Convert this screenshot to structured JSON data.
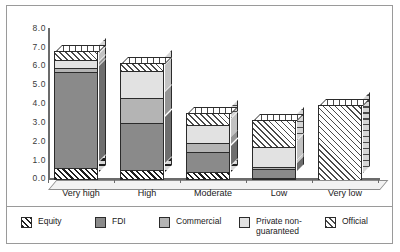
{
  "chart_data": {
    "type": "bar",
    "subtype": "stacked-3d-column",
    "title": "",
    "xlabel": "",
    "ylabel": "",
    "ylim": [
      0.0,
      8.0
    ],
    "ytick_step": 1.0,
    "ytick_labels": [
      "8.0",
      "7.0",
      "6.0",
      "5.0",
      "4.0",
      "3.0",
      "2.0",
      "1.0",
      "0.0"
    ],
    "grid": false,
    "legend_position": "bottom",
    "categories": [
      "Very high",
      "High",
      "Moderate",
      "Low",
      "Very low"
    ],
    "series": [
      {
        "name": "Equity",
        "color": "#1f1f1f",
        "pattern": "diagonal-dark-hatch",
        "values": [
          0.65,
          0.55,
          0.45,
          0.1,
          0.0
        ]
      },
      {
        "name": "FDI",
        "color": "#8a8a8a",
        "pattern": "solid-dark-gray",
        "values": [
          5.1,
          2.5,
          1.05,
          0.5,
          0.0
        ]
      },
      {
        "name": "Commercial",
        "color": "#b4b4b4",
        "pattern": "solid-mid-gray",
        "values": [
          0.2,
          1.3,
          0.45,
          0.1,
          0.0
        ]
      },
      {
        "name": "Private non-guaranteed",
        "color": "#e2e2e2",
        "pattern": "solid-light-gray",
        "values": [
          0.45,
          1.45,
          1.0,
          1.05,
          0.0
        ]
      },
      {
        "name": "Official",
        "color": "#4a4a4a",
        "pattern": "diagonal-light-hatch",
        "values": [
          0.5,
          0.45,
          0.65,
          1.45,
          4.0
        ]
      }
    ],
    "totals": [
      6.9,
      6.25,
      3.6,
      3.2,
      4.0
    ]
  },
  "legend": {
    "items": [
      {
        "label": "Equity",
        "swatch": "equity-swatch"
      },
      {
        "label": "FDI",
        "swatch": "fdi-swatch"
      },
      {
        "label": "Commercial",
        "swatch": "commercial-swatch"
      },
      {
        "label": "Private non-\nguaranteed",
        "swatch": "private-non-guaranteed-swatch"
      },
      {
        "label": "Official",
        "swatch": "official-swatch"
      }
    ]
  }
}
